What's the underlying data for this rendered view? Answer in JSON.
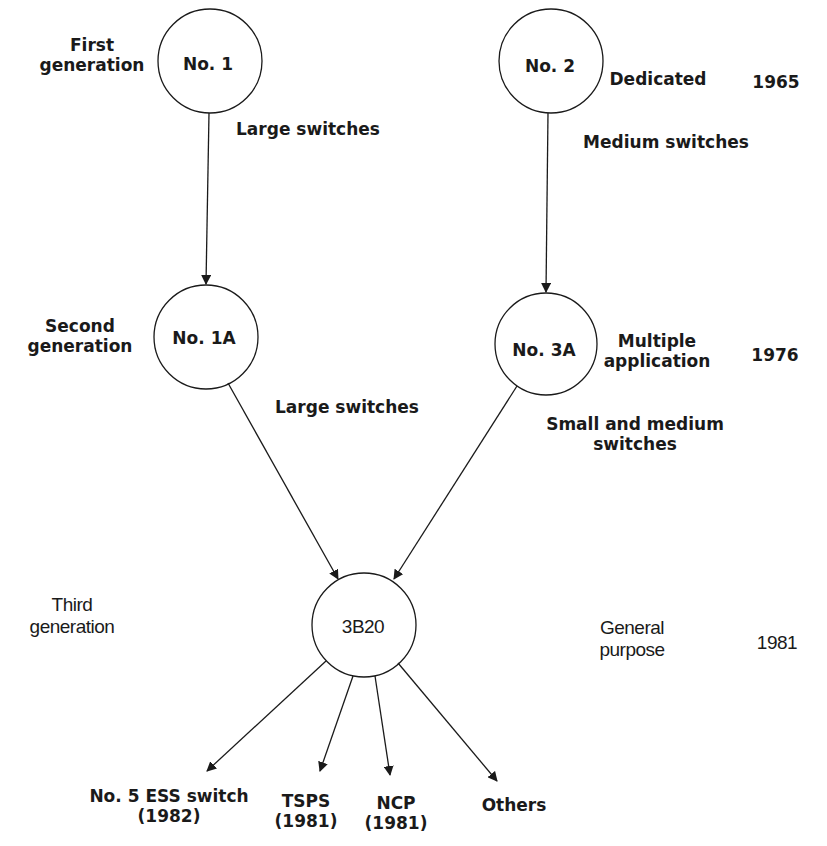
{
  "nodes": {
    "no1": "No. 1",
    "no2": "No. 2",
    "no1a": "No. 1A",
    "no3a": "No. 3A",
    "b3b20": "3B20"
  },
  "generations": {
    "first": [
      "First",
      "generation"
    ],
    "second": [
      "Second",
      "generation"
    ],
    "third": [
      "Third",
      "generation"
    ]
  },
  "descriptors": {
    "dedicated": "Dedicated",
    "multiple_application": [
      "Multiple",
      "application"
    ],
    "general_purpose": [
      "General",
      "purpose"
    ]
  },
  "years": {
    "y1965": "1965",
    "y1976": "1976",
    "y1981": "1981"
  },
  "edge_labels": {
    "no1_to_no1a": "Large switches",
    "no2_to_no3a": "Medium switches",
    "no1a_to_3b20": "Large switches",
    "no3a_to_3b20": [
      "Small and medium",
      "switches"
    ]
  },
  "outputs": [
    {
      "name": "No. 5 ESS switch",
      "year": "(1982)"
    },
    {
      "name": "TSPS",
      "year": "(1981)"
    },
    {
      "name": "NCP",
      "year": "(1981)"
    },
    {
      "name": "Others",
      "year": ""
    }
  ]
}
